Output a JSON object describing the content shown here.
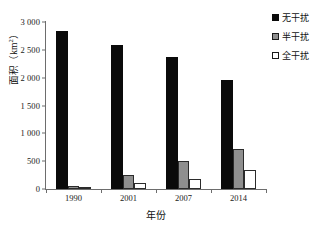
{
  "chart_data": {
    "type": "bar",
    "title": "",
    "xlabel": "年份",
    "ylabel": "面积（km²）",
    "ylabel_base": "面积（km",
    "ylabel_sup": "2",
    "ylabel_tail": "）",
    "categories": [
      "1990",
      "2001",
      "2007",
      "2014"
    ],
    "series": [
      {
        "name": "无干扰",
        "color": "#0a0a0a",
        "values": [
          2830,
          2590,
          2370,
          1960
        ]
      },
      {
        "name": "半干扰",
        "color": "#8f8f8f",
        "values": [
          60,
          250,
          500,
          720
        ]
      },
      {
        "name": "全干扰",
        "color": "#ffffff",
        "values": [
          40,
          100,
          185,
          350
        ]
      }
    ],
    "ylim": [
      0,
      3000
    ],
    "yticks": [
      0,
      500,
      1000,
      1500,
      2000,
      2500,
      3000
    ],
    "ytick_labels": [
      "0",
      "500",
      "1 000",
      "1 500",
      "2 000",
      "2 500",
      "3 000"
    ],
    "grid": false,
    "legend_position": "top-right",
    "axis_color": "#6d6d6d"
  }
}
